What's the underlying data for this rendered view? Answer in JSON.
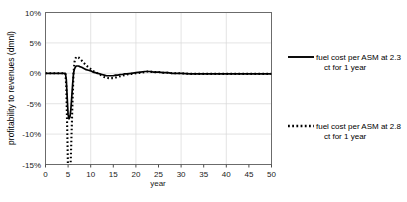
{
  "chart_data": {
    "type": "line",
    "title": "",
    "xlabel": "year",
    "ylabel": "profitability to revenues (dmnl)",
    "xlim": [
      0,
      50
    ],
    "ylim": [
      -0.15,
      0.1
    ],
    "grid": true,
    "legend_position": "right",
    "xticks": [
      0,
      5,
      10,
      15,
      20,
      25,
      30,
      35,
      40,
      45,
      50
    ],
    "xticklabels": [
      "0",
      "5",
      "10",
      "15",
      "20",
      "25",
      "30",
      "35",
      "40",
      "45",
      "50"
    ],
    "yticks": [
      0.1,
      0.05,
      0.0,
      -0.05,
      -0.1,
      -0.15
    ],
    "yticklabels": [
      "10%",
      "5%",
      "0%",
      "-5%",
      "-10%",
      "-15%"
    ],
    "series": [
      {
        "name": "fuel cost per ASM at 2.3 ct for 1 year",
        "style": "solid",
        "color": "#000000",
        "x": [
          0,
          1,
          2,
          3,
          4,
          4.4,
          4.6,
          4.8,
          5.0,
          5.2,
          5.4,
          5.6,
          5.8,
          6.0,
          6.2,
          6.4,
          6.6,
          6.8,
          7.0,
          7.3,
          7.6,
          8.0,
          8.5,
          9.0,
          9.5,
          10.0,
          10.5,
          11.0,
          11.5,
          12.0,
          12.5,
          13.0,
          13.5,
          14.0,
          14.5,
          15.0,
          15.5,
          16.0,
          16.5,
          17.0,
          17.5,
          18.0,
          19.0,
          20.0,
          21.0,
          22.0,
          22.5,
          23.0,
          24.0,
          25.0,
          26.0,
          27.0,
          28.0,
          29.0,
          30.0,
          32.0,
          34.0,
          36.0,
          38.0,
          40.0,
          42.0,
          45.0,
          48.0,
          50.0
        ],
        "y": [
          0.0,
          0.0,
          0.0,
          0.0,
          0.0,
          0.0,
          -0.01,
          -0.04,
          -0.068,
          -0.075,
          -0.072,
          -0.06,
          -0.04,
          -0.018,
          0.0,
          0.007,
          0.01,
          0.012,
          0.012,
          0.012,
          0.011,
          0.01,
          0.008,
          0.006,
          0.005,
          0.004,
          0.002,
          0.001,
          0.0,
          -0.001,
          -0.002,
          -0.003,
          -0.004,
          -0.004,
          -0.004,
          -0.004,
          -0.003,
          -0.003,
          -0.002,
          -0.002,
          -0.001,
          -0.001,
          0.0,
          0.001,
          0.002,
          0.003,
          0.003,
          0.003,
          0.002,
          0.002,
          0.001,
          0.001,
          0.0,
          0.0,
          0.0,
          -0.001,
          -0.001,
          -0.001,
          -0.001,
          -0.001,
          -0.001,
          -0.001,
          -0.001,
          -0.001
        ]
      },
      {
        "name": "fuel cost per ASM at 2.8 ct for 1 year",
        "style": "dotted",
        "color": "#000000",
        "x": [
          0,
          1,
          2,
          3,
          4,
          4.4,
          4.6,
          4.8,
          5.0,
          5.2,
          5.4,
          5.6,
          5.8,
          6.0,
          6.2,
          6.4,
          6.6,
          6.8,
          7.0,
          7.3,
          7.6,
          8.0,
          8.5,
          9.0,
          9.5,
          10.0,
          10.5,
          11.0,
          11.5,
          12.0,
          12.5,
          13.0,
          13.5,
          14.0,
          14.5,
          15.0,
          15.5,
          16.0,
          16.5,
          17.0,
          17.5,
          18.0,
          19.0,
          20.0,
          21.0,
          22.0,
          22.5,
          23.0,
          24.0,
          25.0,
          26.0,
          27.0,
          28.0,
          29.0,
          30.0,
          32.0,
          34.0,
          36.0,
          38.0,
          40.0,
          42.0,
          45.0,
          48.0,
          50.0
        ],
        "y": [
          0.0,
          0.0,
          0.0,
          0.0,
          0.0,
          0.0,
          -0.022,
          -0.09,
          -0.17,
          -0.185,
          -0.175,
          -0.14,
          -0.09,
          -0.04,
          0.0,
          0.018,
          0.024,
          0.027,
          0.027,
          0.026,
          0.024,
          0.021,
          0.017,
          0.013,
          0.01,
          0.007,
          0.004,
          0.002,
          0.0,
          -0.002,
          -0.004,
          -0.006,
          -0.007,
          -0.008,
          -0.008,
          -0.008,
          -0.007,
          -0.006,
          -0.005,
          -0.004,
          -0.003,
          -0.002,
          -0.001,
          0.0,
          0.001,
          0.002,
          0.003,
          0.003,
          0.002,
          0.002,
          0.001,
          0.001,
          0.0,
          0.0,
          0.0,
          -0.001,
          -0.001,
          -0.001,
          -0.001,
          -0.001,
          -0.001,
          -0.001,
          -0.001,
          -0.001
        ]
      }
    ]
  },
  "legend": {
    "entries": [
      {
        "label_line1": "fuel cost per ASM at 2.3",
        "label_line2": "ct for 1 year",
        "style": "solid"
      },
      {
        "label_line1": "fuel cost per ASM at 2.8",
        "label_line2": "ct for 1 year",
        "style": "dotted"
      }
    ]
  }
}
